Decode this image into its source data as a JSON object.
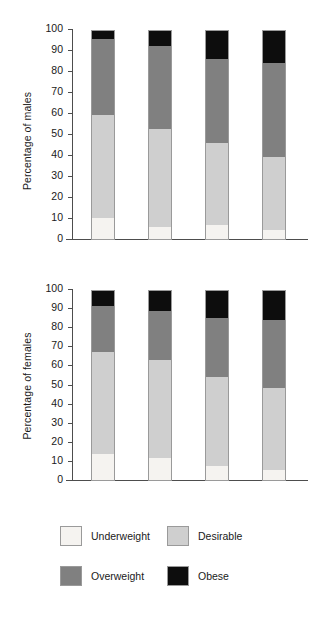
{
  "chart_data": [
    {
      "type": "bar",
      "subtype": "stacked-bar-100",
      "title": "",
      "xlabel": "",
      "ylabel": "Percentage of males",
      "ylim": [
        0,
        100
      ],
      "yticks": [
        0,
        10,
        20,
        30,
        40,
        50,
        60,
        70,
        80,
        90,
        100
      ],
      "ytick_labels": [
        "0",
        "10",
        "20",
        "30",
        "40",
        "50",
        "60",
        "70",
        "80",
        "90",
        "100"
      ],
      "grid": false,
      "legend_position": "bottom",
      "categories": [
        "1980",
        "1987",
        "1991",
        "1995"
      ],
      "series": [
        {
          "name": "Underweight",
          "color": "#f5f3f0",
          "values": [
            10,
            6,
            6.5,
            4.5
          ]
        },
        {
          "name": "Desirable",
          "color": "#cfcfcf",
          "values": [
            49.5,
            47,
            39.5,
            35
          ]
        },
        {
          "name": "Overweight",
          "color": "#808080",
          "values": [
            36.5,
            40,
            40.5,
            45
          ]
        },
        {
          "name": "Obese",
          "color": "#0d0d0d",
          "values": [
            4,
            7,
            13.5,
            15.5
          ]
        }
      ],
      "cumulative_tops": {
        "Underweight": [
          10,
          6,
          6.5,
          4.5
        ],
        "Desirable": [
          59.5,
          53,
          46,
          39.5
        ],
        "Overweight": [
          96,
          93,
          86.5,
          84.5
        ],
        "Obese": [
          100,
          100,
          100,
          100
        ]
      }
    },
    {
      "type": "bar",
      "subtype": "stacked-bar-100",
      "title": "",
      "xlabel": "",
      "ylabel": "Percentage of females",
      "ylim": [
        0,
        100
      ],
      "yticks": [
        0,
        10,
        20,
        30,
        40,
        50,
        60,
        70,
        80,
        90,
        100
      ],
      "ytick_labels": [
        "0",
        "10",
        "20",
        "30",
        "40",
        "50",
        "60",
        "70",
        "80",
        "90",
        "100"
      ],
      "grid": false,
      "legend_position": "bottom",
      "categories": [
        "1980",
        "1987",
        "1991",
        "1995"
      ],
      "series": [
        {
          "name": "Underweight",
          "color": "#f5f3f0",
          "values": [
            14,
            11.5,
            7.5,
            5.5
          ]
        },
        {
          "name": "Desirable",
          "color": "#cfcfcf",
          "values": [
            53.5,
            52,
            47,
            43
          ]
        },
        {
          "name": "Overweight",
          "color": "#808080",
          "values": [
            24.5,
            26,
            31,
            36
          ]
        },
        {
          "name": "Obese",
          "color": "#0d0d0d",
          "values": [
            8,
            10.5,
            14.5,
            15.5
          ]
        }
      ],
      "cumulative_tops": {
        "Underweight": [
          14,
          11.5,
          7.5,
          5.5
        ],
        "Desirable": [
          67.5,
          63.5,
          54.5,
          48.5
        ],
        "Overweight": [
          92,
          89.5,
          85.5,
          84.5
        ],
        "Obese": [
          100,
          100,
          100,
          100
        ]
      }
    }
  ],
  "panels": [
    {
      "name": "males",
      "ylabel": "Percentage of males",
      "yticks": [
        "100",
        "90",
        "80",
        "70",
        "60",
        "50",
        "40",
        "30",
        "20",
        "10",
        "0"
      ],
      "xticks": [
        "1980",
        "1987",
        "1991",
        "1995"
      ]
    },
    {
      "name": "females",
      "ylabel": "Percentage of females",
      "yticks": [
        "100",
        "90",
        "80",
        "70",
        "60",
        "50",
        "40",
        "30",
        "20",
        "10",
        "0"
      ],
      "xticks": [
        "1980",
        "1987",
        "1991",
        "1995"
      ]
    }
  ],
  "legend": {
    "rows": [
      [
        {
          "label": "Underweight",
          "color": "#f5f3f0",
          "swatch_name": "legend-swatch-underweight"
        },
        {
          "label": "Desirable",
          "color": "#cfcfcf",
          "swatch_name": "legend-swatch-desirable"
        }
      ],
      [
        {
          "label": "Overweight",
          "color": "#808080",
          "swatch_name": "legend-swatch-overweight"
        },
        {
          "label": "Obese",
          "color": "#0d0d0d",
          "swatch_name": "legend-swatch-obese"
        }
      ]
    ]
  },
  "colors": {
    "underweight": "#f5f3f0",
    "desirable": "#cfcfcf",
    "overweight": "#808080",
    "obese": "#0d0d0d",
    "axis": "#4d4d4d",
    "text": "#1a1a1a",
    "background": "#ffffff"
  }
}
